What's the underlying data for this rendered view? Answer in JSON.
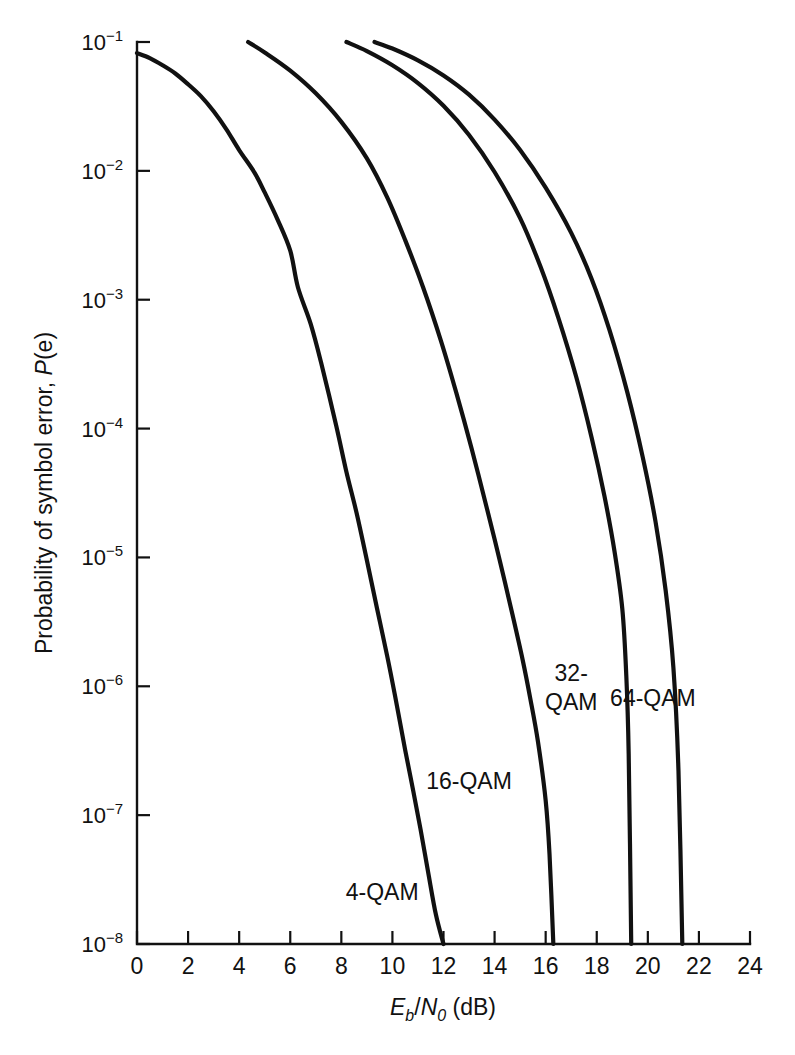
{
  "chart_data": {
    "type": "line",
    "title": "",
    "xlabel": "Eb/N0 (dB)",
    "xlabel_parts": {
      "e": "E",
      "b": "b",
      "slash": "/",
      "n": "N",
      "zero": "0",
      "unit": " (dB)"
    },
    "ylabel": "Probability of symbol error, P(e)",
    "ylabel_parts": {
      "lead": "Probability of symbol error, ",
      "italic": "P",
      "tail": "(e)"
    },
    "xlim": [
      0,
      24
    ],
    "ylim": [
      1e-08,
      0.1
    ],
    "yscale": "log",
    "grid": false,
    "legend_position": "inline-labels",
    "xticks": [
      0,
      2,
      4,
      6,
      8,
      10,
      12,
      14,
      16,
      18,
      20,
      22,
      24
    ],
    "xticklabels": [
      "0",
      "2",
      "4",
      "6",
      "8",
      "10",
      "12",
      "14",
      "16",
      "18",
      "20",
      "22",
      "24"
    ],
    "yticks": [
      0.1,
      0.01,
      0.001,
      0.0001,
      1e-05,
      1e-06,
      1e-07,
      1e-08
    ],
    "yticklabels": [
      "10⁻¹",
      "10⁻²",
      "10⁻³",
      "10⁻⁴",
      "10⁻⁵",
      "10⁻⁶",
      "10⁻⁷",
      "10⁻⁸"
    ],
    "ytick_mantissa": "10",
    "ytick_exponents": [
      "-1",
      "-2",
      "-3",
      "-4",
      "-5",
      "-6",
      "-7",
      "-8"
    ],
    "series": [
      {
        "name": "4-QAM",
        "label": "4-QAM",
        "label_x": 9.6,
        "label_y": 2.2e-08,
        "points": [
          [
            0.0,
            0.082
          ],
          [
            0.5,
            0.075
          ],
          [
            1.0,
            0.066
          ],
          [
            1.5,
            0.057
          ],
          [
            2.0,
            0.047
          ],
          [
            2.5,
            0.038
          ],
          [
            3.0,
            0.029
          ],
          [
            3.5,
            0.021
          ],
          [
            4.0,
            0.0145
          ],
          [
            4.6,
            0.0097
          ],
          [
            5.0,
            0.0068
          ],
          [
            5.5,
            0.0042
          ],
          [
            6.0,
            0.0024
          ],
          [
            6.3,
            0.00125
          ],
          [
            6.8,
            0.00065
          ],
          [
            7.2,
            0.00033
          ],
          [
            7.8,
            0.000105
          ],
          [
            8.2,
            4.6e-05
          ],
          [
            8.6,
            2.2e-05
          ],
          [
            9.0,
            9.5e-06
          ],
          [
            9.4,
            4e-06
          ],
          [
            9.8,
            1.7e-06
          ],
          [
            10.1,
            8.5e-07
          ],
          [
            10.5,
            3.2e-07
          ],
          [
            10.8,
            1.6e-07
          ],
          [
            11.1,
            7.8e-08
          ],
          [
            11.4,
            3.6e-08
          ],
          [
            11.7,
            1.7e-08
          ],
          [
            12.0,
            1e-08
          ]
        ]
      },
      {
        "name": "16-QAM",
        "label": "16-QAM",
        "label_x": 13.0,
        "label_y": 1.6e-07,
        "points": [
          [
            4.35,
            0.1
          ],
          [
            5.0,
            0.083
          ],
          [
            6.0,
            0.06
          ],
          [
            7.0,
            0.04
          ],
          [
            8.0,
            0.024
          ],
          [
            9.0,
            0.0125
          ],
          [
            9.8,
            0.0062
          ],
          [
            10.5,
            0.0029
          ],
          [
            11.2,
            0.00125
          ],
          [
            11.9,
            0.00048
          ],
          [
            12.5,
            0.00019
          ],
          [
            13.1,
            7e-05
          ],
          [
            13.7,
            2.4e-05
          ],
          [
            14.2,
            9.5e-06
          ],
          [
            14.7,
            3.6e-06
          ],
          [
            15.1,
            1.6e-06
          ],
          [
            15.4,
            8e-07
          ],
          [
            15.7,
            3.7e-07
          ],
          [
            16.0,
            1.3e-07
          ],
          [
            16.15,
            5e-08
          ],
          [
            16.3,
            1e-08
          ]
        ]
      },
      {
        "name": "32-QAM",
        "label": "32-",
        "label2": "QAM",
        "label_x": 17.0,
        "label_y": 1.1e-06,
        "points": [
          [
            8.2,
            0.1
          ],
          [
            9.0,
            0.085
          ],
          [
            10.0,
            0.066
          ],
          [
            11.0,
            0.048
          ],
          [
            12.0,
            0.032
          ],
          [
            13.0,
            0.019
          ],
          [
            14.0,
            0.0098
          ],
          [
            15.0,
            0.0043
          ],
          [
            15.8,
            0.0018
          ],
          [
            16.5,
            0.00072
          ],
          [
            17.2,
            0.00025
          ],
          [
            17.8,
            8.5e-05
          ],
          [
            18.3,
            3e-05
          ],
          [
            18.7,
            1.1e-05
          ],
          [
            19.0,
            4e-06
          ],
          [
            19.15,
            1.3e-06
          ],
          [
            19.25,
            3e-07
          ],
          [
            19.35,
            1e-08
          ]
        ]
      },
      {
        "name": "64-QAM",
        "label": "64-QAM",
        "label_x": 20.2,
        "label_y": 7e-07,
        "points": [
          [
            9.3,
            0.1
          ],
          [
            10.0,
            0.089
          ],
          [
            11.0,
            0.072
          ],
          [
            12.0,
            0.055
          ],
          [
            13.0,
            0.039
          ],
          [
            14.0,
            0.025
          ],
          [
            15.0,
            0.0145
          ],
          [
            16.0,
            0.0074
          ],
          [
            17.0,
            0.0033
          ],
          [
            17.8,
            0.00145
          ],
          [
            18.5,
            0.00058
          ],
          [
            19.2,
            0.00019
          ],
          [
            19.8,
            6e-05
          ],
          [
            20.3,
            1.9e-05
          ],
          [
            20.7,
            5.5e-06
          ],
          [
            21.0,
            1.4e-06
          ],
          [
            21.2,
            2.2e-07
          ],
          [
            21.35,
            1e-08
          ]
        ]
      }
    ]
  },
  "geometry": {
    "plot_left": 137,
    "plot_right": 750,
    "plot_top": 42,
    "plot_bottom": 944
  }
}
